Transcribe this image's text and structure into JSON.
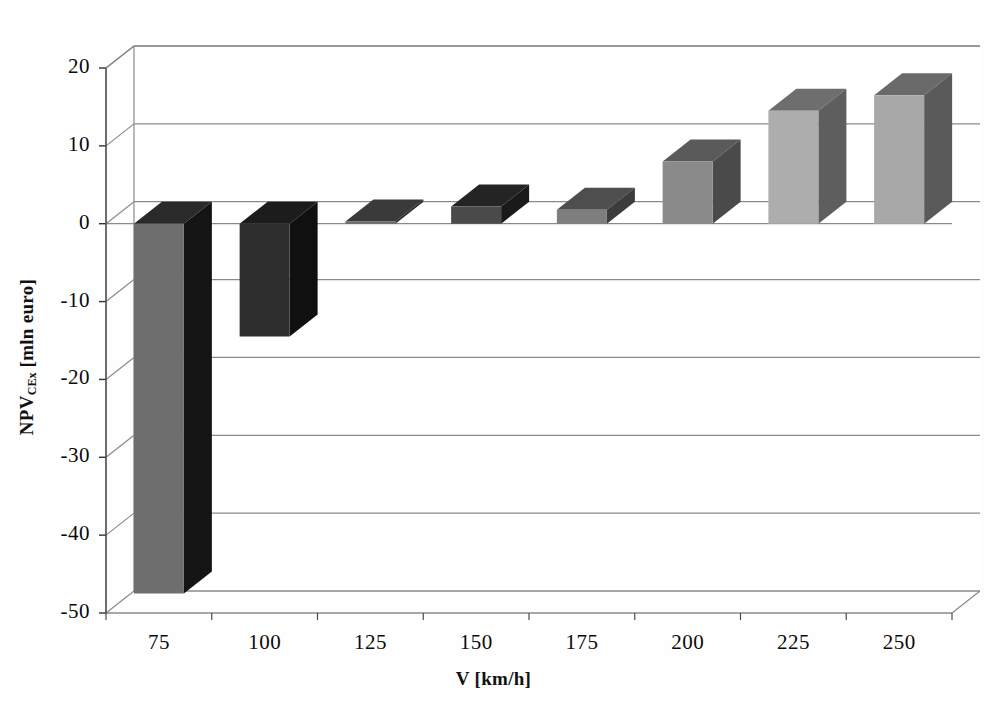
{
  "chart_data": {
    "type": "bar",
    "title": "",
    "subtitle": "",
    "xlabel": "V [km/h]",
    "ylabel": "NPV_CEx [mln euro]",
    "ylabel_main": "NPV",
    "ylabel_sub": "CEx",
    "ylabel_unit": "[mln euro]",
    "categories": [
      "75",
      "100",
      "125",
      "150",
      "175",
      "200",
      "225",
      "250"
    ],
    "values": [
      -47.5,
      -14.5,
      0.3,
      2.2,
      1.8,
      8.0,
      14.5,
      16.5
    ],
    "series": [
      {
        "name": "NPV_CEx",
        "values": [
          -47.5,
          -14.5,
          0.3,
          2.2,
          1.8,
          8.0,
          14.5,
          16.5
        ]
      }
    ],
    "ylim": [
      -50,
      20
    ],
    "yticks": [
      20,
      10,
      0,
      -10,
      -20,
      -30,
      -40,
      -50
    ],
    "ytick_labels": [
      "20",
      "10",
      "0",
      "-10",
      "-20",
      "-30",
      "-40",
      "-50"
    ],
    "grid": true,
    "grid_axis": "y",
    "legend": "none",
    "three_d": true,
    "bar_colors_front": [
      "#6e6e6e",
      "#2e2e2e",
      "#6a6a6a",
      "#4a4a4a",
      "#7e7e7e",
      "#8a8a8a",
      "#adadad",
      "#a8a8a8"
    ],
    "bar_colors_side": [
      "#141414",
      "#101010",
      "#2a2a2a",
      "#1a1a1a",
      "#3c3c3c",
      "#4a4a4a",
      "#5e5e5e",
      "#5a5a5a"
    ],
    "bar_colors_top": [
      "#2a2a2a",
      "#1c1c1c",
      "#3a3a3a",
      "#242424",
      "#4e4e4e",
      "#5a5a5a",
      "#6e6e6e",
      "#6a6a6a"
    ],
    "background_color": "#fefefe",
    "axis_color": "#8a8a8a",
    "text_color": "#0a0a0a"
  }
}
